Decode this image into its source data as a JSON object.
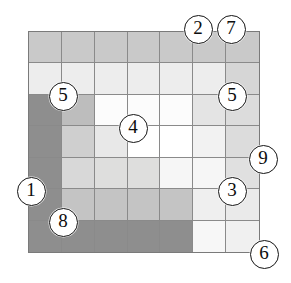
{
  "figure": {
    "type": "annotated-grid-diagram",
    "grid": {
      "rows": 7,
      "cols": 7,
      "left": 28,
      "top": 31,
      "width": 232,
      "height": 222,
      "border_color": "#7a7a7a",
      "line_color": "#8a8a8a",
      "cell_fills": [
        [
          "#c9c9c9",
          "#c9c9c9",
          "#c9c9c9",
          "#c9c9c9",
          "#c9c9c9",
          "#c9c9c9",
          "#c9c9c9"
        ],
        [
          "#ededed",
          "#ededed",
          "#ededed",
          "#ededed",
          "#ededed",
          "#ededed",
          "#d6d6d6"
        ],
        [
          "#8e8e8e",
          "#bdbdbd",
          "#fcfcfc",
          "#fcfcfc",
          "#fcfcfc",
          "#e4e4e4",
          "#dcdcdc"
        ],
        [
          "#8e8e8e",
          "#cfcfcf",
          "#e8e8e8",
          "#ffffff",
          "#ffffff",
          "#f2f2f2",
          "#dcdcdc"
        ],
        [
          "#8e8e8e",
          "#d8d8d8",
          "#dededd",
          "#dededd",
          "#f6f6f6",
          "#f6f6f6",
          "#e0e0e0"
        ],
        [
          "#8e8e8e",
          "#c4c4c4",
          "#c4c4c4",
          "#c4c4c4",
          "#c4c4c4",
          "#efefef",
          "#eaeaea"
        ],
        [
          "#8e8e8e",
          "#8e8e8e",
          "#8e8e8e",
          "#8e8e8e",
          "#8e8e8e",
          "#f7f7f7",
          "#f0f0f0"
        ]
      ]
    },
    "markers": [
      {
        "label": "2",
        "x": 197,
        "y": 28,
        "name": "marker-2"
      },
      {
        "label": "7",
        "x": 230,
        "y": 28,
        "name": "marker-7"
      },
      {
        "label": "5",
        "x": 62,
        "y": 95,
        "name": "marker-5-left"
      },
      {
        "label": "5",
        "x": 231,
        "y": 95,
        "name": "marker-5-right"
      },
      {
        "label": "4",
        "x": 132,
        "y": 127,
        "name": "marker-4"
      },
      {
        "label": "9",
        "x": 262,
        "y": 158,
        "name": "marker-9"
      },
      {
        "label": "1",
        "x": 30,
        "y": 190,
        "name": "marker-1"
      },
      {
        "label": "3",
        "x": 231,
        "y": 190,
        "name": "marker-3"
      },
      {
        "label": "8",
        "x": 62,
        "y": 221,
        "name": "marker-8"
      },
      {
        "label": "6",
        "x": 263,
        "y": 253,
        "name": "marker-6"
      }
    ]
  }
}
